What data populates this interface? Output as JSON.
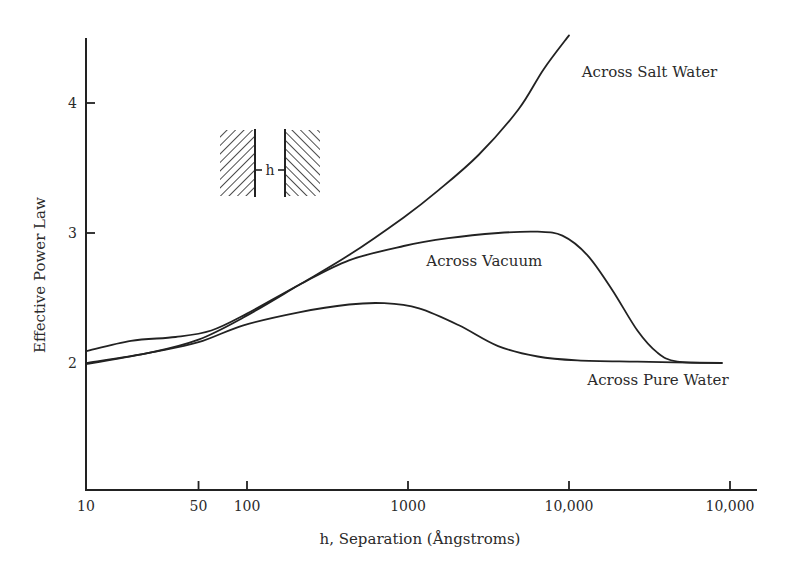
{
  "chart_data": {
    "type": "line",
    "title": "",
    "xlabel": "h, Separation (Ångstroms)",
    "ylabel": "Effective Power Law",
    "xscale": "log",
    "xlim": [
      10,
      30000
    ],
    "ylim": [
      1.0,
      4.5
    ],
    "grid": false,
    "legend": "none (inline curve labels)",
    "x_ticks": [
      {
        "value": 10,
        "label": "10"
      },
      {
        "value": 50,
        "label": "50"
      },
      {
        "value": 100,
        "label": "100"
      },
      {
        "value": 1000,
        "label": "1000"
      },
      {
        "value": 10000,
        "label": "10,000"
      },
      {
        "value": 100000,
        "label": "10,000",
        "note": "label as printed in source (log position of 100,000)"
      }
    ],
    "y_ticks": [
      {
        "value": 2,
        "label": "2"
      },
      {
        "value": 3,
        "label": "3"
      },
      {
        "value": 4,
        "label": "4"
      }
    ],
    "series": [
      {
        "name": "Across Salt Water",
        "label_anchor": {
          "x": 12000,
          "y": 4.2
        },
        "points": [
          [
            10,
            2.0
          ],
          [
            25,
            2.08
          ],
          [
            50,
            2.18
          ],
          [
            95,
            2.35
          ],
          [
            210,
            2.6
          ],
          [
            430,
            2.83
          ],
          [
            940,
            3.12
          ],
          [
            1550,
            3.33
          ],
          [
            2740,
            3.6
          ],
          [
            4850,
            3.95
          ],
          [
            6960,
            4.26
          ],
          [
            10000,
            4.52
          ]
        ]
      },
      {
        "name": "Across Vacuum",
        "label_anchor": {
          "x": 1300,
          "y": 2.75
        },
        "points": [
          [
            10,
            2.09
          ],
          [
            19,
            2.17
          ],
          [
            36,
            2.2
          ],
          [
            60,
            2.25
          ],
          [
            100,
            2.38
          ],
          [
            210,
            2.6
          ],
          [
            430,
            2.79
          ],
          [
            940,
            2.9
          ],
          [
            1780,
            2.96
          ],
          [
            3630,
            3.0
          ],
          [
            6390,
            3.01
          ],
          [
            9100,
            2.98
          ],
          [
            13000,
            2.83
          ],
          [
            18600,
            2.56
          ],
          [
            26600,
            2.25
          ],
          [
            35400,
            2.08
          ],
          [
            47100,
            2.01
          ],
          [
            88900,
            2.0
          ]
        ]
      },
      {
        "name": "Across Pure Water",
        "label_anchor": {
          "x": 13000,
          "y": 1.83
        },
        "points": [
          [
            10,
            1.99
          ],
          [
            25,
            2.08
          ],
          [
            50,
            2.16
          ],
          [
            95,
            2.29
          ],
          [
            210,
            2.39
          ],
          [
            430,
            2.45
          ],
          [
            710,
            2.46
          ],
          [
            1170,
            2.42
          ],
          [
            2070,
            2.29
          ],
          [
            3630,
            2.13
          ],
          [
            6390,
            2.05
          ],
          [
            11300,
            2.02
          ],
          [
            26600,
            2.01
          ],
          [
            88900,
            2.0
          ]
        ]
      }
    ],
    "inset": {
      "description": "two hatched half-spaces separated by gap",
      "gap_label": "h"
    }
  }
}
